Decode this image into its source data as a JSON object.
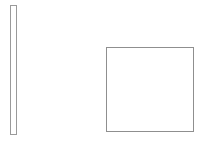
{
  "canvas": {
    "width": 204,
    "height": 141,
    "background_color": "#ffffff",
    "label": "Shapes canvas"
  },
  "shapes": [
    {
      "name": "vertical-bar",
      "type": "rectangle",
      "label": "Tall narrow vertical rectangle",
      "x": 10,
      "y": 5,
      "width": 7,
      "height": 130,
      "stroke_color": "#9a9a9a",
      "stroke_width": 1,
      "fill_color": "#ffffff"
    },
    {
      "name": "square",
      "type": "rectangle",
      "label": "Large empty square",
      "x": 106,
      "y": 47,
      "width": 88,
      "height": 85,
      "stroke_color": "#8f8f8f",
      "stroke_width": 1,
      "fill_color": "#ffffff"
    }
  ]
}
